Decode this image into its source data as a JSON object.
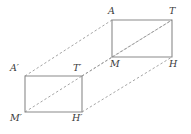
{
  "figure": {
    "kind": "geometry-diagram",
    "canvas": {
      "width": 191,
      "height": 134
    },
    "background_color": "#ffffff",
    "stroke_color": "#8a8a8a",
    "dash_color": "#9a9a9a",
    "label_color": "#3a3a3a"
  },
  "shapes": {
    "rectangles": [
      {
        "name": "rectangle-ATHM",
        "vertices": [
          {
            "id": "A",
            "x": 112,
            "y": 20
          },
          {
            "id": "T",
            "x": 172,
            "y": 20
          },
          {
            "id": "H",
            "x": 172,
            "y": 57
          },
          {
            "id": "M",
            "x": 112,
            "y": 57
          }
        ]
      },
      {
        "name": "rectangle-ATHM-prime",
        "vertices": [
          {
            "id": "A'",
            "x": 25,
            "y": 76
          },
          {
            "id": "T'",
            "x": 82,
            "y": 76
          },
          {
            "id": "H'",
            "x": 82,
            "y": 112
          },
          {
            "id": "M'",
            "x": 25,
            "y": 112
          }
        ]
      }
    ],
    "dashed_segments": [
      {
        "name": "diagonal-M-T",
        "x1": 112,
        "y1": 57,
        "x2": 172,
        "y2": 20
      },
      {
        "name": "diagonal-Mprime-Tprime",
        "x1": 25,
        "y1": 112,
        "x2": 82,
        "y2": 76
      },
      {
        "name": "connector-Aprime-A",
        "x1": 25,
        "y1": 76,
        "x2": 112,
        "y2": 20
      },
      {
        "name": "connector-Tprime-M",
        "x1": 82,
        "y1": 76,
        "x2": 112,
        "y2": 57
      },
      {
        "name": "connector-Hprime-H",
        "x1": 82,
        "y1": 112,
        "x2": 172,
        "y2": 57
      },
      {
        "name": "connector-Tprime-T",
        "x1": 82,
        "y1": 76,
        "x2": 172,
        "y2": 20
      }
    ]
  },
  "labels": [
    {
      "name": "vertex-label-A",
      "text": "A",
      "x": 108,
      "y": 6,
      "align": "left"
    },
    {
      "name": "vertex-label-T",
      "text": "T",
      "x": 169,
      "y": 6,
      "align": "left"
    },
    {
      "name": "vertex-label-M",
      "text": "M",
      "x": 110,
      "y": 59,
      "align": "left"
    },
    {
      "name": "vertex-label-H",
      "text": "H",
      "x": 169,
      "y": 59,
      "align": "left"
    },
    {
      "name": "vertex-label-A-prime",
      "text": "A′",
      "x": 10,
      "y": 63,
      "align": "left"
    },
    {
      "name": "vertex-label-T-prime",
      "text": "T′",
      "x": 73,
      "y": 63,
      "align": "left"
    },
    {
      "name": "vertex-label-M-prime",
      "text": "M′",
      "x": 10,
      "y": 113,
      "align": "left"
    },
    {
      "name": "vertex-label-H-prime",
      "text": "H′",
      "x": 72,
      "y": 113,
      "align": "left"
    }
  ]
}
